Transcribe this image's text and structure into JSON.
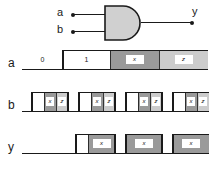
{
  "figure": {
    "kind": "digital-logic-timing-diagram",
    "gate": {
      "type": "AND",
      "inputs": [
        {
          "name": "a",
          "label": "a"
        },
        {
          "name": "b",
          "label": "b"
        }
      ],
      "output": {
        "name": "y",
        "label": "y"
      }
    },
    "colors": {
      "line": "#1a1a1a",
      "gate_fill": "#d0d0d0",
      "unknown_x": "#9a9a9a",
      "highz_z": "#cccccc",
      "high_fill": "#ffffff",
      "background": "#ffffff"
    },
    "legend_values": {
      "zero": "0",
      "one": "1",
      "unknown": "x",
      "high_impedance": "z"
    },
    "signals": [
      {
        "name": "a",
        "label": "a",
        "segments": [
          {
            "state": "0",
            "label": "0",
            "start": 22,
            "end": 63
          },
          {
            "state": "1",
            "label": "1",
            "start": 63,
            "end": 110
          },
          {
            "state": "x",
            "label": "x",
            "start": 110,
            "end": 159
          },
          {
            "state": "z",
            "label": "z",
            "start": 159,
            "end": 208
          }
        ]
      },
      {
        "name": "b",
        "label": "b",
        "segments": [
          {
            "state": "0",
            "label": "",
            "start": 22,
            "end": 32
          },
          {
            "state": "1",
            "label": "",
            "start": 32,
            "end": 44
          },
          {
            "state": "x",
            "label": "x",
            "start": 44,
            "end": 56
          },
          {
            "state": "z",
            "label": "z",
            "start": 56,
            "end": 68
          },
          {
            "state": "0",
            "label": "",
            "start": 68,
            "end": 79
          },
          {
            "state": "1",
            "label": "",
            "start": 79,
            "end": 91
          },
          {
            "state": "x",
            "label": "x",
            "start": 91,
            "end": 103
          },
          {
            "state": "z",
            "label": "z",
            "start": 103,
            "end": 115
          },
          {
            "state": "0",
            "label": "",
            "start": 115,
            "end": 126
          },
          {
            "state": "1",
            "label": "",
            "start": 126,
            "end": 138
          },
          {
            "state": "x",
            "label": "x",
            "start": 138,
            "end": 150
          },
          {
            "state": "z",
            "label": "z",
            "start": 150,
            "end": 162
          },
          {
            "state": "0",
            "label": "",
            "start": 162,
            "end": 173
          },
          {
            "state": "1",
            "label": "",
            "start": 173,
            "end": 185
          },
          {
            "state": "x",
            "label": "x",
            "start": 185,
            "end": 197
          },
          {
            "state": "z",
            "label": "z",
            "start": 197,
            "end": 209
          }
        ]
      },
      {
        "name": "y",
        "label": "y",
        "segments": [
          {
            "state": "0",
            "label": "",
            "start": 22,
            "end": 76
          },
          {
            "state": "1",
            "label": "",
            "start": 76,
            "end": 88
          },
          {
            "state": "x",
            "label": "x",
            "start": 88,
            "end": 115
          },
          {
            "state": "0",
            "label": "",
            "start": 115,
            "end": 126
          },
          {
            "state": "x",
            "label": "x",
            "start": 126,
            "end": 162
          },
          {
            "state": "0",
            "label": "",
            "start": 162,
            "end": 173
          },
          {
            "state": "x",
            "label": "x",
            "start": 173,
            "end": 209
          }
        ]
      }
    ]
  }
}
